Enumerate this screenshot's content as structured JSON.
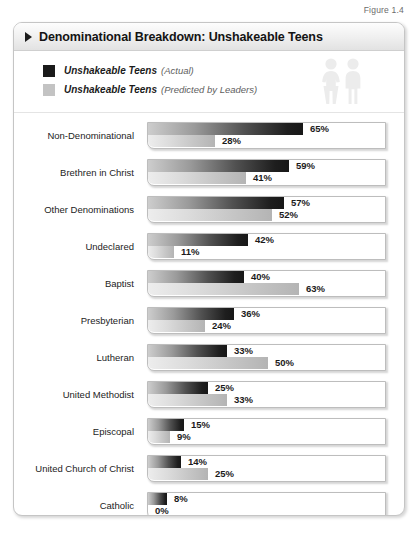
{
  "figure_caption": "Figure 1.4",
  "header": {
    "title": "Denominational Breakdown: Unshakeable Teens",
    "bullet_icon": "triangle-right-icon"
  },
  "legend": {
    "items": [
      {
        "name": "Unshakeable Teens",
        "qualifier": "(Actual)",
        "color": "#1a1a1a",
        "swatch_icon": "legend-swatch-dark"
      },
      {
        "name": "Unshakeable Teens",
        "qualifier": "(Predicted by Leaders)",
        "color": "#c3c3c3",
        "swatch_icon": "legend-swatch-light"
      }
    ],
    "graphic_icon": "two-people-icon"
  },
  "chart_data": {
    "type": "bar",
    "orientation": "horizontal",
    "title": "Denominational Breakdown: Unshakeable Teens",
    "xlabel": "",
    "ylabel": "",
    "xlim": [
      0,
      100
    ],
    "grid": false,
    "legend_position": "top-left",
    "value_suffix": "%",
    "categories": [
      "Non-Denominational",
      "Brethren in Christ",
      "Other Denominations",
      "Undeclared",
      "Baptist",
      "Presbyterian",
      "Lutheran",
      "United Methodist",
      "Episcopal",
      "United Church of Christ",
      "Catholic"
    ],
    "series": [
      {
        "name": "Unshakeable Teens (Actual)",
        "color": "#1a1a1a",
        "values": [
          65,
          59,
          57,
          42,
          40,
          36,
          33,
          25,
          15,
          14,
          8
        ],
        "labels": [
          "65%",
          "59%",
          "57%",
          "42%",
          "40%",
          "36%",
          "33%",
          "25%",
          "15%",
          "14%",
          "8%"
        ]
      },
      {
        "name": "Unshakeable Teens (Predicted by Leaders)",
        "color": "#c3c3c3",
        "values": [
          28,
          41,
          52,
          11,
          63,
          24,
          50,
          33,
          9,
          25,
          0
        ],
        "labels": [
          "28%",
          "41%",
          "52%",
          "11%",
          "63%",
          "24%",
          "50%",
          "33%",
          "9%",
          "25%",
          "0%"
        ]
      }
    ]
  }
}
